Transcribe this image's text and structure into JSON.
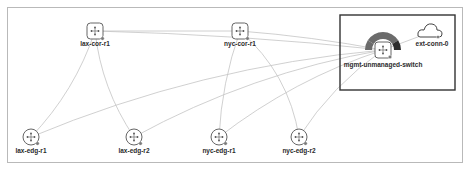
{
  "diagram": {
    "type": "network-topology",
    "selection": {
      "label": "selected-group",
      "members": [
        "mgmt-unmanaged-switch",
        "ext-conn-0"
      ]
    },
    "nodes": [
      {
        "id": "lax-cor-r1",
        "label": "lax-cor-r1",
        "kind": "core-router",
        "icon": "router-square-icon"
      },
      {
        "id": "nyc-cor-r1",
        "label": "nyc-cor-r1",
        "kind": "core-router",
        "icon": "router-square-icon"
      },
      {
        "id": "mgmt-unmanaged-switch",
        "label": "mgmt-unmanaged-switch",
        "kind": "switch",
        "icon": "switch-icon",
        "status_ring": true
      },
      {
        "id": "ext-conn-0",
        "label": "ext-conn-0",
        "kind": "external-connection",
        "icon": "cloud-icon"
      },
      {
        "id": "lax-edg-r1",
        "label": "lax-edg-r1",
        "kind": "edge-router",
        "icon": "router-circle-icon"
      },
      {
        "id": "lax-edg-r2",
        "label": "lax-edg-r2",
        "kind": "edge-router",
        "icon": "router-circle-icon"
      },
      {
        "id": "nyc-edg-r1",
        "label": "nyc-edg-r1",
        "kind": "edge-router",
        "icon": "router-circle-icon"
      },
      {
        "id": "nyc-edg-r2",
        "label": "nyc-edg-r2",
        "kind": "edge-router",
        "icon": "router-circle-icon"
      }
    ],
    "links": [
      {
        "source": "lax-cor-r1",
        "target": "nyc-cor-r1"
      },
      {
        "source": "lax-cor-r1",
        "target": "mgmt-unmanaged-switch"
      },
      {
        "source": "nyc-cor-r1",
        "target": "mgmt-unmanaged-switch"
      },
      {
        "source": "lax-cor-r1",
        "target": "lax-edg-r1"
      },
      {
        "source": "lax-cor-r1",
        "target": "lax-edg-r2"
      },
      {
        "source": "nyc-cor-r1",
        "target": "nyc-edg-r1"
      },
      {
        "source": "nyc-cor-r1",
        "target": "nyc-edg-r2"
      },
      {
        "source": "lax-edg-r1",
        "target": "mgmt-unmanaged-switch"
      },
      {
        "source": "lax-edg-r2",
        "target": "mgmt-unmanaged-switch"
      },
      {
        "source": "nyc-edg-r1",
        "target": "mgmt-unmanaged-switch"
      },
      {
        "source": "nyc-edg-r2",
        "target": "mgmt-unmanaged-switch"
      },
      {
        "source": "mgmt-unmanaged-switch",
        "target": "ext-conn-0"
      }
    ],
    "colors": {
      "link": "#c4c4c4",
      "node_stroke": "#555555",
      "selection_border": "#333333",
      "ring_main": "#6b6b6b",
      "ring_dark": "#2e2e2e"
    }
  }
}
